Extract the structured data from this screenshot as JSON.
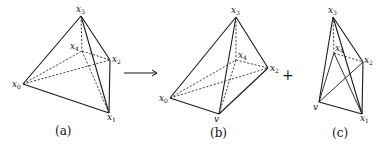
{
  "figures": [
    {
      "id": "a",
      "caption": "(a)",
      "vertices": {
        "x0": {
          "label": "x",
          "sub": "0",
          "pos": [
            23,
            84
          ]
        },
        "x1": {
          "label": "x",
          "sub": "1",
          "pos": [
            109,
            113
          ]
        },
        "x2": {
          "label": "x",
          "sub": "2",
          "pos": [
            110,
            60
          ]
        },
        "x3": {
          "label": "x",
          "sub": "3",
          "pos": [
            81,
            16
          ]
        },
        "x4": {
          "label": "x",
          "sub": "4",
          "pos": [
            82,
            51
          ]
        }
      },
      "solid_edges": [
        [
          "x0",
          "x3"
        ],
        [
          "x3",
          "x2"
        ],
        [
          "x2",
          "x1"
        ],
        [
          "x1",
          "x0"
        ],
        [
          "x3",
          "x1"
        ]
      ],
      "dashed_edges": [
        [
          "x0",
          "x4"
        ],
        [
          "x4",
          "x2"
        ],
        [
          "x0",
          "x2"
        ],
        [
          "x3",
          "x4"
        ],
        [
          "x4",
          "x1"
        ]
      ]
    },
    {
      "id": "b",
      "caption": "(b)",
      "vertices": {
        "x0": {
          "label": "x",
          "sub": "0",
          "pos": [
            170,
            98
          ]
        },
        "v": {
          "label": "v",
          "sub": "",
          "pos": [
            219,
            114
          ]
        },
        "x2": {
          "label": "x",
          "sub": "2",
          "pos": [
            268,
            68
          ]
        },
        "x3": {
          "label": "x",
          "sub": "3",
          "pos": [
            236,
            17
          ]
        },
        "x4": {
          "label": "x",
          "sub": "4",
          "pos": [
            236,
            60
          ]
        }
      },
      "solid_edges": [
        [
          "x0",
          "x3"
        ],
        [
          "x3",
          "x2"
        ],
        [
          "x2",
          "v"
        ],
        [
          "v",
          "x0"
        ],
        [
          "x3",
          "v"
        ]
      ],
      "dashed_edges": [
        [
          "x0",
          "x4"
        ],
        [
          "x4",
          "x2"
        ],
        [
          "x0",
          "x2"
        ],
        [
          "x3",
          "x4"
        ],
        [
          "x4",
          "v"
        ]
      ]
    },
    {
      "id": "c",
      "caption": "(c)",
      "vertices": {
        "v": {
          "label": "v",
          "sub": "",
          "pos": [
            319,
            102
          ]
        },
        "x1": {
          "label": "x",
          "sub": "1",
          "pos": [
            362,
            114
          ]
        },
        "x2": {
          "label": "x",
          "sub": "2",
          "pos": [
            363,
            62
          ]
        },
        "x3": {
          "label": "x",
          "sub": "3",
          "pos": [
            333,
            17
          ]
        },
        "x4": {
          "label": "x",
          "sub": "4",
          "pos": [
            334,
            53
          ]
        }
      },
      "solid_edges": [
        [
          "x3",
          "v"
        ],
        [
          "x3",
          "x2"
        ],
        [
          "x2",
          "x1"
        ],
        [
          "x1",
          "v"
        ],
        [
          "x3",
          "x1"
        ],
        [
          "v",
          "x2"
        ],
        [
          "x4",
          "v"
        ],
        [
          "x4",
          "x1"
        ]
      ],
      "dashed_edges": [
        [
          "x3",
          "x4"
        ],
        [
          "x4",
          "x2"
        ]
      ]
    }
  ],
  "operators": {
    "arrow": "⟶",
    "plus": "+"
  }
}
